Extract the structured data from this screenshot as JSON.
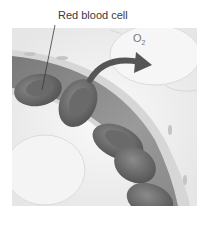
{
  "diagram": {
    "labels": {
      "red_blood_cell": "Red blood cell",
      "oxygen": "O",
      "oxygen_subscript": "2"
    },
    "colors": {
      "background": "#ffffff",
      "tissue": "#ececec",
      "vessel_wall": "#d9d9d9",
      "vessel_lumen": "#8a8a8a",
      "cell": "#6e6e6e",
      "arrow": "#5a5a5a",
      "text": "#3a3a3a"
    }
  }
}
